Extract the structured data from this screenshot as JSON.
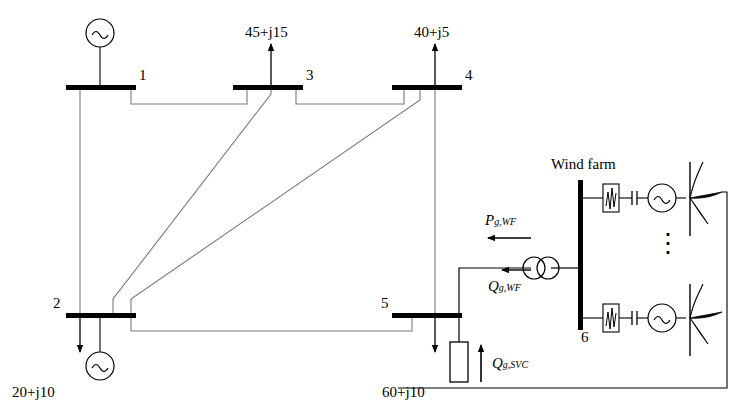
{
  "diagram": {
    "buses": [
      {
        "id": "bus1",
        "label": "1"
      },
      {
        "id": "bus3",
        "label": "3"
      },
      {
        "id": "bus4",
        "label": "4"
      },
      {
        "id": "bus2",
        "label": "2"
      },
      {
        "id": "bus5",
        "label": "5"
      },
      {
        "id": "bus6",
        "label": "6"
      }
    ],
    "loads": [
      {
        "id": "load-bus3",
        "label": "45+j15"
      },
      {
        "id": "load-bus4",
        "label": "40+j5"
      },
      {
        "id": "load-bus2",
        "label": "20+j10"
      },
      {
        "id": "load-bus5",
        "label": "60+j10"
      }
    ],
    "annotations": {
      "wind_farm": "Wind farm",
      "p_g_wf_main": "P",
      "p_g_wf_sub": "g,WF",
      "q_g_wf_main": "Q",
      "q_g_wf_sub": "g,WF",
      "q_g_svc_main": "Q",
      "q_g_svc_sub": "g,SVC",
      "vertical_dots": "⋮"
    },
    "colors": {
      "line": "#000000",
      "thin_line": "#7a7a7a",
      "background": "#ffffff"
    }
  }
}
